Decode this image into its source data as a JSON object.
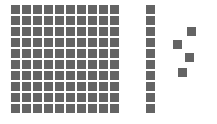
{
  "diagram": {
    "type": "base-ten-blocks",
    "color": "#646464",
    "block_size": 9,
    "pitch": 11,
    "hundred": {
      "x": 11,
      "y": 5,
      "rows": 10,
      "cols": 10,
      "value": 100
    },
    "ten": {
      "x": 146,
      "y": 5,
      "rows": 10,
      "cols": 1,
      "value": 10
    },
    "ones": [
      {
        "x": 187,
        "y": 27
      },
      {
        "x": 173,
        "y": 40
      },
      {
        "x": 185,
        "y": 53
      },
      {
        "x": 178,
        "y": 68
      }
    ],
    "total_value": 114
  }
}
